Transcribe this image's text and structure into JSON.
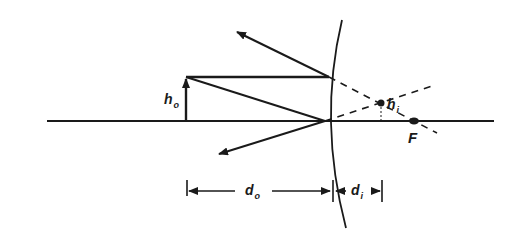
{
  "diagram": {
    "type": "convex-mirror-ray-diagram",
    "stroke_color": "#1a1a1a",
    "background": "#ffffff",
    "labels": {
      "object_height": {
        "main": "h",
        "sub": "o"
      },
      "image_height": {
        "main": "h",
        "sub": "i"
      },
      "focal_point": "F",
      "object_distance": {
        "main": "d",
        "sub": "o"
      },
      "image_distance": {
        "main": "d",
        "sub": "i"
      }
    },
    "elements": {
      "optical_axis": {
        "x1": 47,
        "y1": 121,
        "x2": 494,
        "y2": 121
      },
      "mirror_curve": {
        "top": [
          342,
          20
        ],
        "vertex": [
          326,
          121
        ],
        "bottom": [
          346,
          228
        ]
      },
      "object_arrow": {
        "x": 186,
        "base_y": 121,
        "tip_y": 77
      },
      "image_point": [
        381,
        103
      ],
      "focal_point": [
        413,
        121
      ]
    }
  }
}
